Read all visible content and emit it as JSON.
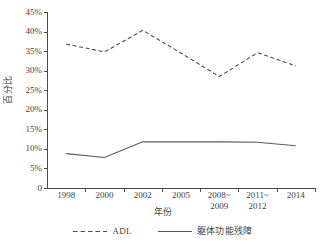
{
  "chart_data": {
    "type": "line",
    "title": "",
    "xlabel": "年份",
    "ylabel": "百分比",
    "categories": [
      "1998",
      "2000",
      "2002",
      "2005",
      "2008~\n2009",
      "2011~\n2012",
      "2014"
    ],
    "ylim": [
      0,
      45
    ],
    "ytick_labels": [
      "45%",
      "40%",
      "35%",
      "30%",
      "25%",
      "20%",
      "15%",
      "10%",
      "5%",
      "0"
    ],
    "ytick_values": [
      45,
      40,
      35,
      30,
      25,
      20,
      15,
      10,
      5,
      0
    ],
    "grid": false,
    "legend_position": "bottom",
    "series": [
      {
        "name": "ADL",
        "style": "dashed",
        "color": "#4d4d4d",
        "values": [
          36.8,
          34.8,
          40.3,
          34.5,
          28.5,
          34.6,
          31.2
        ]
      },
      {
        "name": "躯体功能残障",
        "style": "solid",
        "color": "#595959",
        "values": [
          8.8,
          7.8,
          11.8,
          11.8,
          11.8,
          11.7,
          10.8
        ]
      }
    ]
  },
  "legend": {
    "items": [
      {
        "label": "ADL",
        "style": "dashed"
      },
      {
        "label": "躯体功能残障",
        "style": "solid"
      }
    ]
  }
}
